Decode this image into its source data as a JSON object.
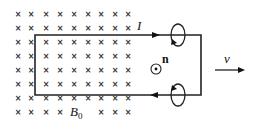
{
  "diagram": {
    "type": "physics-circuit-in-magnetic-field",
    "field": {
      "symbol": "×",
      "meaning": "magnetic field into page",
      "label": "B",
      "label_subscript": "0",
      "rows_y": [
        14,
        28,
        42,
        56,
        70,
        84,
        98,
        112
      ],
      "cols_x": [
        18,
        31,
        46,
        60,
        74,
        88,
        101,
        115,
        128
      ],
      "label_position": {
        "x": 70,
        "y": 116
      }
    },
    "loop": {
      "left_x": 35,
      "right_x": 201,
      "top_y": 35,
      "bottom_y": 95,
      "color": "#222222"
    },
    "labels": {
      "current": "I",
      "normal": "n",
      "velocity": "v"
    },
    "current_arrows": [
      {
        "direction": "right",
        "x": 155,
        "y": 35
      },
      {
        "direction": "left",
        "x": 155,
        "y": 95
      }
    ],
    "rotation_symbols": [
      {
        "cx": 178,
        "cy": 35
      },
      {
        "cx": 178,
        "cy": 95
      }
    ],
    "normal_symbol": {
      "type": "dot-in-circle",
      "cx": 156,
      "cy": 69
    },
    "velocity_arrow": {
      "x1": 215,
      "x2": 245,
      "y": 70
    }
  }
}
